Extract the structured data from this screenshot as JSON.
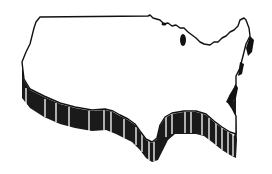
{
  "illustration": {
    "subject": "Contiguous United States map outline with 3D extruded edge",
    "style": "black-and-white line art",
    "colors": {
      "background": "#ffffff",
      "outline": "#111111",
      "extrusion": "#1a1a1a",
      "stripe": "#ffffff"
    }
  }
}
